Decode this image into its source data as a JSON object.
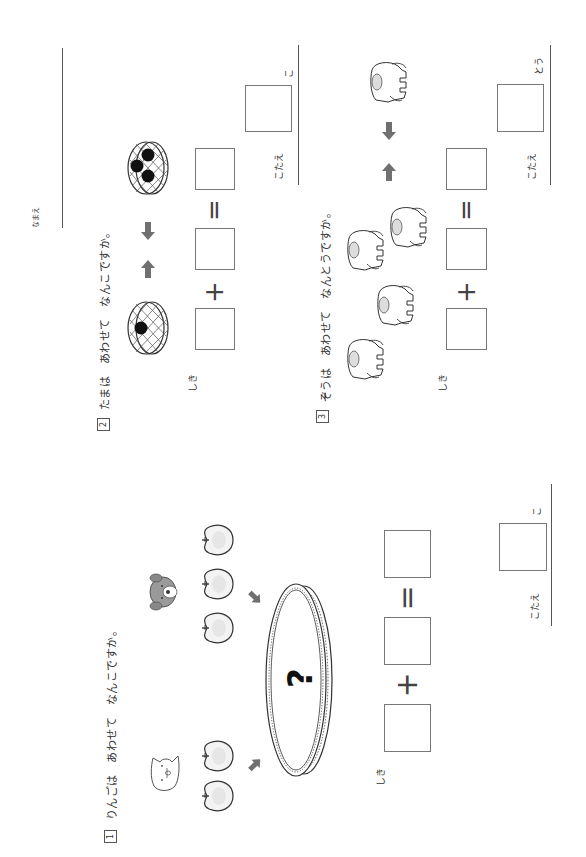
{
  "header": {
    "name_label": "なまえ"
  },
  "sections": [
    {
      "number": "1",
      "question": "りんごは　あわせて　なんこですか。",
      "illustration": {
        "groups": [
          {
            "animal": "cat-icon",
            "item": "apple-icon",
            "count": 2
          },
          {
            "animal": "dog-icon",
            "item": "apple-icon",
            "count": 3
          }
        ],
        "container": "bowl-icon",
        "container_label": "?"
      },
      "equation": {
        "label": "しき",
        "plus": "+",
        "equals": "="
      },
      "answer": {
        "label": "こたえ",
        "unit": "こ"
      }
    },
    {
      "number": "2",
      "question": "たまは　あわせて　なんこですか。",
      "illustration": {
        "groups": [
          {
            "item": "basket-icon",
            "balls": 1
          },
          {
            "item": "basket-icon",
            "balls": 3
          }
        ]
      },
      "equation": {
        "label": "しき",
        "plus": "+",
        "equals": "="
      },
      "answer": {
        "label": "こたえ",
        "unit": "こ"
      }
    },
    {
      "number": "3",
      "question": "ぞうは　あわせて　なんとうですか。",
      "illustration": {
        "groups": [
          {
            "item": "elephant-icon",
            "count": 4
          },
          {
            "item": "elephant-icon",
            "count": 1
          }
        ]
      },
      "equation": {
        "label": "しき",
        "plus": "+",
        "equals": "="
      },
      "answer": {
        "label": "こたえ",
        "unit": "とう"
      }
    }
  ],
  "colors": {
    "line": "#555555",
    "arrow": "#707070",
    "ball": "#111111",
    "apple_fill": "#f2f2f2"
  }
}
